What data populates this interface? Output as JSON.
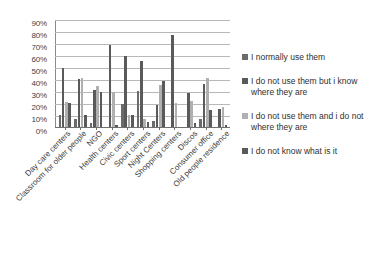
{
  "chart_data": {
    "type": "bar",
    "title": "",
    "xlabel": "",
    "ylabel": "",
    "ylim": [
      0,
      90
    ],
    "grid": true,
    "legend_position": "right",
    "y_ticks": [
      "0%",
      "10%",
      "20%",
      "30%",
      "40%",
      "50%",
      "60%",
      "70%",
      "80%",
      "90%"
    ],
    "categories": [
      "Day care centers",
      "Classroom for older people",
      "NGO",
      "Health centers",
      "Civic centers",
      "Sport centers",
      "Night Centers",
      "Shopping centers",
      "Discos",
      "Consumer office",
      "Old people residence"
    ],
    "series": [
      {
        "name": "I normally use them",
        "color": "#6b6b6b",
        "values": [
          10,
          7,
          3,
          0,
          19,
          30,
          5,
          0,
          0,
          7,
          0
        ]
      },
      {
        "name": "I do not use them but i know where they are",
        "color": "#5a5a5a",
        "values": [
          49,
          40,
          31,
          68,
          59,
          55,
          18,
          77,
          28,
          36,
          15
        ]
      },
      {
        "name": "I do not use them and i do not where they are",
        "color": "#b0b0b0",
        "values": [
          21,
          41,
          34,
          29,
          10,
          7,
          35,
          20,
          22,
          41,
          17
        ]
      },
      {
        "name": "I do not know what is it",
        "color": "#5a5a5a",
        "values": [
          20,
          10,
          29,
          2,
          10,
          4,
          38,
          0,
          3,
          14,
          2
        ]
      }
    ]
  },
  "legend": {
    "items": [
      {
        "label": "I normally use them",
        "color": "#6b6b6b"
      },
      {
        "label": "I do not use them but i know where they are",
        "color": "#5a5a5a"
      },
      {
        "label": "I do not use them and i do not where they are",
        "color": "#b0b0b0"
      },
      {
        "label": "I do not know what is it",
        "color": "#5a5a5a"
      }
    ]
  }
}
